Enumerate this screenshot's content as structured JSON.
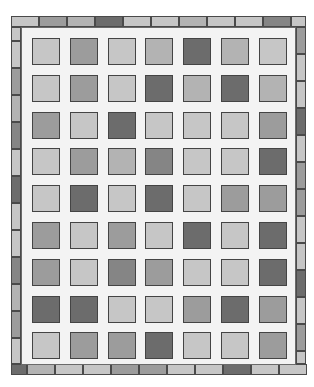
{
  "palette": {
    "L": "#c6c6c6",
    "ML": "#b3b3b3",
    "M": "#9c9c9c",
    "MD": "#858585",
    "D": "#6c6c6c",
    "sashing": "#f4f4f4"
  },
  "grid": {
    "columns": 7,
    "rows": 9,
    "blocks": [
      [
        "L",
        "M",
        "L",
        "ML",
        "D",
        "ML",
        "L"
      ],
      [
        "L",
        "M",
        "L",
        "D",
        "ML",
        "D",
        "ML"
      ],
      [
        "M",
        "L",
        "D",
        "L",
        "L",
        "L",
        "M"
      ],
      [
        "L",
        "M",
        "ML",
        "MD",
        "L",
        "L",
        "D"
      ],
      [
        "L",
        "D",
        "L",
        "D",
        "L",
        "M",
        "M"
      ],
      [
        "M",
        "L",
        "M",
        "L",
        "D",
        "L",
        "D"
      ],
      [
        "M",
        "L",
        "MD",
        "M",
        "L",
        "L",
        "D"
      ],
      [
        "D",
        "D",
        "L",
        "L",
        "M",
        "D",
        "M"
      ],
      [
        "L",
        "M",
        "M",
        "D",
        "L",
        "L",
        "M"
      ]
    ]
  },
  "border": {
    "top": [
      "L",
      "M",
      "ML",
      "D",
      "L",
      "L",
      "ML",
      "L",
      "L",
      "MD"
    ],
    "top_corner": "L",
    "bottom_corner": "D",
    "bottom": [
      "ML",
      "L",
      "L",
      "M",
      "M",
      "L",
      "L",
      "D",
      "L",
      "L"
    ],
    "left_corner": "L",
    "left": [
      "L",
      "M",
      "ML",
      "MD",
      "L",
      "D",
      "L",
      "L",
      "MD",
      "ML",
      "M",
      "L"
    ],
    "right": [
      "M",
      "L",
      "L",
      "D",
      "L",
      "M",
      "M",
      "L",
      "L",
      "D",
      "L",
      "M"
    ],
    "right_corner": "L"
  }
}
